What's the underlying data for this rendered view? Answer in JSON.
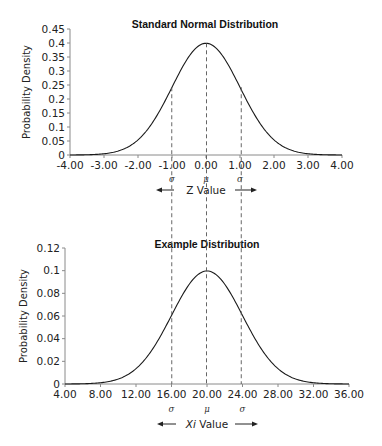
{
  "chart_data": [
    {
      "type": "line",
      "title": "Standard Normal  Distribution",
      "xlabel": "Z Value",
      "ylabel": "Probability Density",
      "xlim": [
        -4,
        4
      ],
      "ylim": [
        0,
        0.45
      ],
      "x_ticks": [
        "-4.00",
        "-3.00",
        "-2.00",
        "-1.00",
        "0.00",
        "1.00",
        "2.00",
        "3.00",
        "4.00"
      ],
      "y_ticks": [
        "0",
        "0.05",
        "0.1",
        "0.15",
        "0.2",
        "0.25",
        "0.3",
        "0.35",
        "0.4",
        "0.45"
      ],
      "series": [
        {
          "name": "Standard normal pdf",
          "mean": 0,
          "sd": 1,
          "x": [
            -4,
            -3,
            -2,
            -1,
            0,
            1,
            2,
            3,
            4
          ],
          "values": [
            0.0001,
            0.0044,
            0.054,
            0.242,
            0.399,
            0.242,
            0.054,
            0.0044,
            0.0001
          ]
        }
      ],
      "markers": [
        {
          "x": -1,
          "label": "σ"
        },
        {
          "x": 0,
          "label": "μ"
        },
        {
          "x": 1,
          "label": "σ"
        }
      ],
      "grid": false,
      "legend": "none"
    },
    {
      "type": "line",
      "title": "Example Distribution",
      "xlabel_italic": "Xi",
      "xlabel": " Value",
      "ylabel": "Probability Density",
      "xlim": [
        4,
        36
      ],
      "ylim": [
        0,
        0.12
      ],
      "x_ticks": [
        "4.00",
        "8.00",
        "12.00",
        "16.00",
        "20.00",
        "24.00",
        "28.00",
        "32.00",
        "36.00"
      ],
      "y_ticks": [
        "0",
        "0.02",
        "0.04",
        "0.06",
        "0.08",
        "0.1",
        "0.12"
      ],
      "series": [
        {
          "name": "Example pdf",
          "mean": 20,
          "sd": 4,
          "x": [
            4,
            8,
            12,
            16,
            20,
            24,
            28,
            32,
            36
          ],
          "values": [
            3e-05,
            0.0011,
            0.0135,
            0.0605,
            0.0997,
            0.0605,
            0.0135,
            0.0011,
            3e-05
          ]
        }
      ],
      "markers": [
        {
          "x": 16,
          "label": "σ"
        },
        {
          "x": 20,
          "label": "μ"
        },
        {
          "x": 24,
          "label": "σ"
        }
      ],
      "grid": false,
      "legend": "none"
    }
  ],
  "colors": {
    "curve": "#1a1a1a",
    "axis": "#8a8a8a",
    "dashed": "#555555",
    "text": "#222222"
  },
  "arrows": {
    "left": "←",
    "right": "→"
  }
}
